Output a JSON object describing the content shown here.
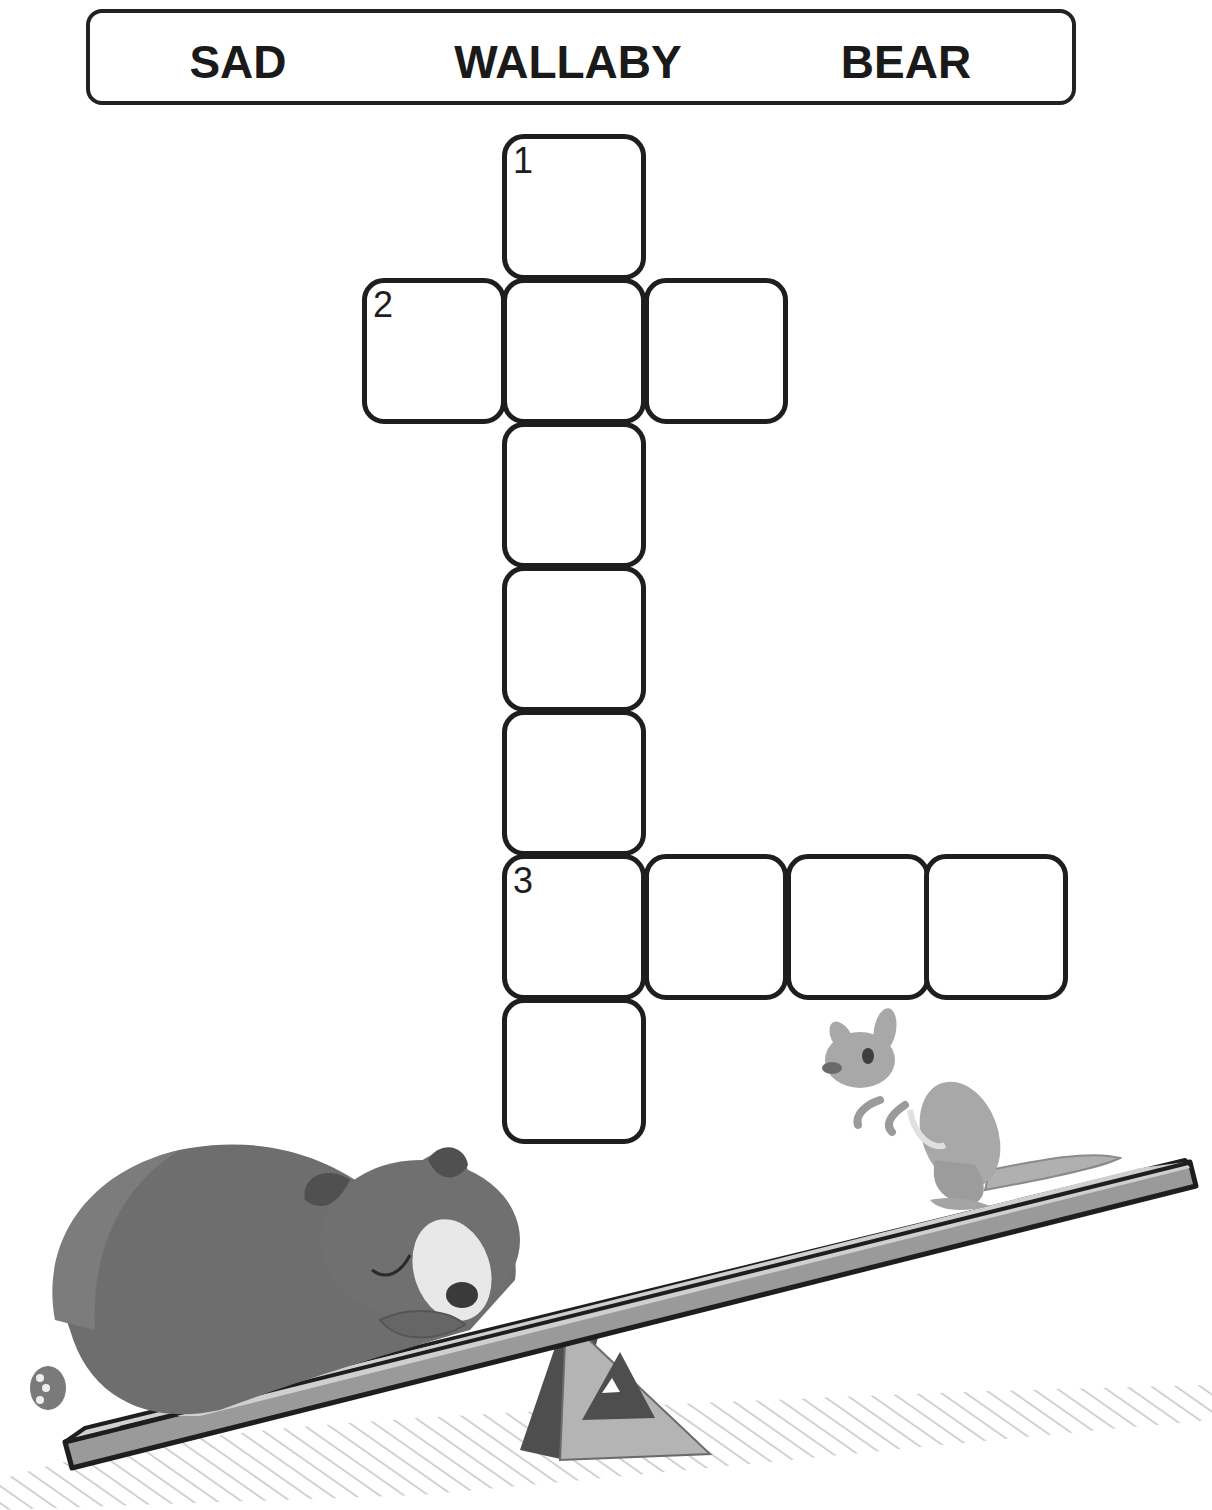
{
  "word_bank": {
    "words": [
      "SAD",
      "WALLABY",
      "BEAR"
    ]
  },
  "crossword": {
    "clue_numbers": [
      "1",
      "2",
      "3"
    ],
    "cells": [
      {
        "id": "c1",
        "x": 502,
        "y": 134,
        "number": "1",
        "value": ""
      },
      {
        "id": "c2",
        "x": 362,
        "y": 278,
        "number": "2",
        "value": ""
      },
      {
        "id": "c3",
        "x": 502,
        "y": 278,
        "number": "",
        "value": ""
      },
      {
        "id": "c4",
        "x": 644,
        "y": 278,
        "number": "",
        "value": ""
      },
      {
        "id": "c5",
        "x": 502,
        "y": 422,
        "number": "",
        "value": ""
      },
      {
        "id": "c6",
        "x": 502,
        "y": 566,
        "number": "",
        "value": ""
      },
      {
        "id": "c7",
        "x": 502,
        "y": 710,
        "number": "",
        "value": ""
      },
      {
        "id": "c8",
        "x": 502,
        "y": 854,
        "number": "3",
        "value": ""
      },
      {
        "id": "c9",
        "x": 644,
        "y": 854,
        "number": "",
        "value": ""
      },
      {
        "id": "c10",
        "x": 786,
        "y": 854,
        "number": "",
        "value": ""
      },
      {
        "id": "c11",
        "x": 924,
        "y": 854,
        "number": "",
        "value": ""
      },
      {
        "id": "c12",
        "x": 502,
        "y": 998,
        "number": "",
        "value": ""
      }
    ]
  },
  "illustration": {
    "characters": [
      "sleeping-bear",
      "wallaby"
    ],
    "props": [
      "seesaw",
      "triangle-fulcrum",
      "hatched-ground-shadow"
    ]
  },
  "colors": {
    "outline": "#1e1e1e",
    "bear_body": "#6e6e6e",
    "bear_dark": "#4a4a4a",
    "wallaby_body": "#a8a8a8",
    "plank_top": "#c8c8c8",
    "plank_side": "#9a9a9a",
    "fulcrum_dark": "#4e4e4e",
    "fulcrum_light": "#b4b4b4",
    "hatch": "#c4c4c4"
  }
}
